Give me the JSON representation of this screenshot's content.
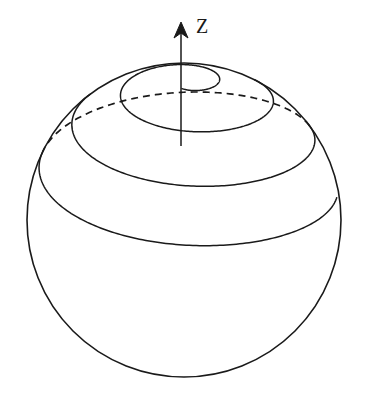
{
  "figure": {
    "background_color": "#ffffff",
    "stroke_color": "#1a1a1a",
    "width": 365,
    "height": 418
  },
  "axis": {
    "label": "Z",
    "label_x": 196,
    "label_y": 16,
    "shaft_x": 181,
    "tip_y": 22,
    "base_y": 146,
    "head_half_width": 7,
    "head_length": 16,
    "direction": "up"
  },
  "sphere": {
    "center_x": 184,
    "center_y": 220,
    "radius": 157,
    "outline_style": "solid"
  },
  "spiral": {
    "description": "Spiral curve wound on the sphere surface, seen in oblique projection; front portion solid, rear portion dashed",
    "projection_tilt": 0.46,
    "turns": 3.25,
    "start_angle_deg": -96,
    "inner_end_x": 227,
    "inner_end_y": 142,
    "visible_style": "solid",
    "hidden_style": "dashed",
    "hidden_dash_pattern": "7 5",
    "theta_start": 0.12,
    "theta_end": 1.36,
    "samples": 900,
    "hidden_span_deg": [
      180,
      360
    ]
  },
  "chart_data": {
    "type": "line",
    "xlabel": "",
    "ylabel": "",
    "series": [
      {
        "name": "sphere-outline",
        "kind": "circle",
        "center": [
          184,
          220
        ],
        "radius": 157
      },
      {
        "name": "z-axis",
        "kind": "arrow",
        "from": [
          181,
          146
        ],
        "to": [
          181,
          22
        ],
        "label": "Z"
      },
      {
        "name": "spiral-path",
        "kind": "parametric",
        "parameter": "theta (polar angle from north pole, radians)",
        "theta_range": [
          0.12,
          1.36
        ],
        "winding_turns": 3.25,
        "visible_fraction": 0.62
      }
    ],
    "legend_position": "none",
    "grid": false
  }
}
